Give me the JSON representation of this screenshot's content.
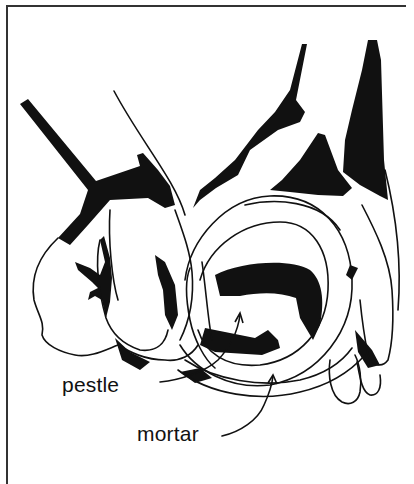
{
  "figure": {
    "labels": [
      {
        "id": "pestle",
        "text": "pestle"
      },
      {
        "id": "mortar",
        "text": "mortar"
      }
    ]
  },
  "colors": {
    "ink": "#111111",
    "frame": "#333333",
    "paper": "#ffffff"
  }
}
